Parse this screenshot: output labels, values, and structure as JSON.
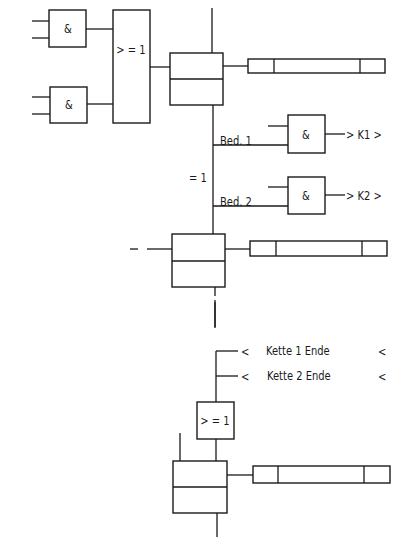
{
  "diagram": {
    "type": "sequence-chain-diagram (GRAFCET-style steps with logic gates)",
    "top_section": {
      "and_gate_1": {
        "symbol": "&"
      },
      "and_gate_2": {
        "symbol": "&"
      },
      "or_gate": {
        "symbol": ">=1",
        "display": "> = 1"
      },
      "step_1": {
        "kind": "step-box"
      },
      "action_1": {
        "kind": "action-bar"
      }
    },
    "branch": {
      "label": "= 1",
      "condition_1": {
        "label": "Bed. 1",
        "gate": "&",
        "output": "> K1 >"
      },
      "condition_2": {
        "label": "Bed. 2",
        "gate": "&",
        "output": "> K2 >"
      }
    },
    "middle_section": {
      "step_2": {
        "kind": "step-box"
      },
      "action_2": {
        "kind": "action-bar"
      }
    },
    "bottom_section": {
      "chain_end_1": {
        "prefix": "<",
        "label": "Kette 1 Ende",
        "suffix": "<"
      },
      "chain_end_2": {
        "prefix": "<",
        "label": "Kette 2 Ende",
        "suffix": "<"
      },
      "or_gate": {
        "symbol": ">=1",
        "display": "> = 1"
      },
      "step_3": {
        "kind": "step-box"
      },
      "action_3": {
        "kind": "action-bar"
      }
    }
  }
}
